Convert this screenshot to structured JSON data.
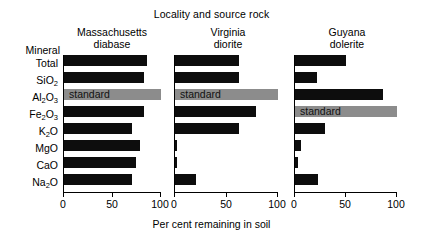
{
  "chart_data": {
    "type": "bar",
    "orientation": "horizontal",
    "title": "Locality and source rock",
    "xlabel": "Per cent remaining in soil",
    "ylabel": "Mineral",
    "categories": [
      "Total",
      "SiO2",
      "Al2O3",
      "Fe2O3",
      "K2O",
      "MgO",
      "CaO",
      "Na2O"
    ],
    "category_labels": [
      "Total",
      "SiO₂",
      "Al₂O₃",
      "Fe₂O₃",
      "K₂O",
      "MgO",
      "CaO",
      "Na₂O"
    ],
    "xlim": [
      0,
      100
    ],
    "xticks": [
      0,
      50,
      100
    ],
    "xtick_labels": [
      "0",
      "50",
      "100"
    ],
    "grid": false,
    "legend": false,
    "standard_label": "standard",
    "colors": {
      "bar": "#0d0d0d",
      "standard": "#8c8c8c",
      "axis": "#000000",
      "background": "#ffffff"
    },
    "series": [
      {
        "name": "Massachusetts diabase",
        "title_line1": "Massachusetts",
        "title_line2": "diabase",
        "standard_category": "Al2O3",
        "values": [
          86,
          82,
          100,
          82,
          70,
          78,
          74,
          70
        ]
      },
      {
        "name": "Virginia diorite",
        "title_line1": "Virginia",
        "title_line2": "diorite",
        "standard_category": "Al2O3",
        "values": [
          62,
          62,
          100,
          79,
          62,
          2,
          2,
          20
        ]
      },
      {
        "name": "Guyana dolerite",
        "title_line1": "Guyana",
        "title_line2": "dolerite",
        "standard_category": "Fe2O3",
        "values": [
          50,
          22,
          86,
          100,
          29,
          6,
          3,
          23
        ]
      }
    ]
  },
  "panels": [
    {
      "title_line1": "Massachusetts",
      "title_line2": "diabase"
    },
    {
      "title_line1": "Virginia",
      "title_line2": "diorite"
    },
    {
      "title_line1": "Guyana",
      "title_line2": "dolerite"
    }
  ],
  "header": {
    "mineral": "Mineral"
  },
  "axis": {
    "tick0": "0",
    "tick50": "50",
    "tick100": "100",
    "xlabel": "Per cent remaining in soil"
  },
  "title": "Locality and source rock"
}
